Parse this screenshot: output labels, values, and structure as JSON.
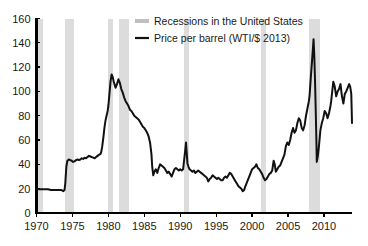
{
  "chart_data": {
    "type": "line",
    "title": "",
    "subtitle": "",
    "xlabel": "",
    "ylabel": "",
    "xlim": [
      1970,
      2013.9
    ],
    "ylim": [
      0,
      160
    ],
    "grid": false,
    "legend_position": "top-center",
    "y_ticks": [
      0,
      20,
      40,
      60,
      80,
      100,
      120,
      140,
      160
    ],
    "y_tick_labels": [
      "0",
      "20",
      "40",
      "60",
      "80",
      "100",
      "120",
      "140",
      "160"
    ],
    "x_ticks": [
      1970,
      1975,
      1980,
      1985,
      1990,
      1995,
      2000,
      2005,
      2010
    ],
    "x_tick_labels": [
      "1970",
      "1975",
      "1980",
      "1985",
      "1990",
      "1995",
      "2000",
      "2005",
      "2010"
    ],
    "legend": [
      {
        "label": "Recessions in the United States",
        "type": "band",
        "color": "#bfbfbf"
      },
      {
        "label": "Price per barrel (WTI/$ 2013)",
        "type": "line",
        "color": "#111111"
      }
    ],
    "series": [
      {
        "name": "Price per barrel (WTI/$ 2013)",
        "color": "#111111",
        "x": [
          1970.0,
          1970.4,
          1970.8,
          1971.2,
          1971.6,
          1972.0,
          1972.4,
          1972.8,
          1973.0,
          1973.2,
          1973.4,
          1973.6,
          1973.75,
          1973.9,
          1974.0,
          1974.15,
          1974.3,
          1974.5,
          1974.7,
          1974.9,
          1975.1,
          1975.3,
          1975.5,
          1975.7,
          1975.9,
          1976.1,
          1976.3,
          1976.5,
          1976.7,
          1976.9,
          1977.1,
          1977.3,
          1977.5,
          1977.7,
          1977.9,
          1978.1,
          1978.3,
          1978.5,
          1978.7,
          1978.9,
          1979.0,
          1979.15,
          1979.3,
          1979.45,
          1979.6,
          1979.75,
          1979.9,
          1980.0,
          1980.15,
          1980.3,
          1980.45,
          1980.6,
          1980.75,
          1980.9,
          1981.0,
          1981.2,
          1981.4,
          1981.6,
          1981.8,
          1982.0,
          1982.2,
          1982.4,
          1982.6,
          1982.8,
          1983.0,
          1983.2,
          1983.4,
          1983.6,
          1983.8,
          1984.0,
          1984.2,
          1984.4,
          1984.6,
          1984.8,
          1985.0,
          1985.2,
          1985.4,
          1985.6,
          1985.8,
          1986.0,
          1986.1,
          1986.25,
          1986.4,
          1986.6,
          1986.8,
          1987.0,
          1987.2,
          1987.4,
          1987.6,
          1987.8,
          1988.0,
          1988.2,
          1988.4,
          1988.6,
          1988.8,
          1989.0,
          1989.2,
          1989.4,
          1989.6,
          1989.8,
          1990.0,
          1990.2,
          1990.4,
          1990.55,
          1990.7,
          1990.8,
          1990.9,
          1991.0,
          1991.15,
          1991.3,
          1991.5,
          1991.7,
          1991.9,
          1992.1,
          1992.3,
          1992.5,
          1992.7,
          1992.9,
          1993.1,
          1993.3,
          1993.5,
          1993.7,
          1993.9,
          1994.1,
          1994.3,
          1994.5,
          1994.7,
          1994.9,
          1995.1,
          1995.3,
          1995.5,
          1995.7,
          1995.9,
          1996.1,
          1996.3,
          1996.5,
          1996.7,
          1996.9,
          1997.1,
          1997.3,
          1997.5,
          1997.7,
          1997.9,
          1998.1,
          1998.3,
          1998.5,
          1998.7,
          1998.9,
          1999.0,
          1999.2,
          1999.4,
          1999.6,
          1999.8,
          2000.0,
          2000.2,
          2000.4,
          2000.6,
          2000.8,
          2001.0,
          2001.2,
          2001.4,
          2001.6,
          2001.8,
          2002.0,
          2002.2,
          2002.4,
          2002.6,
          2002.8,
          2003.0,
          2003.15,
          2003.3,
          2003.5,
          2003.7,
          2003.9,
          2004.1,
          2004.3,
          2004.5,
          2004.7,
          2004.9,
          2005.1,
          2005.3,
          2005.5,
          2005.7,
          2005.9,
          2006.1,
          2006.3,
          2006.5,
          2006.7,
          2006.9,
          2007.1,
          2007.3,
          2007.5,
          2007.7,
          2007.9,
          2008.0,
          2008.15,
          2008.3,
          2008.45,
          2008.55,
          2008.65,
          2008.75,
          2008.85,
          2008.95,
          2009.0,
          2009.15,
          2009.3,
          2009.5,
          2009.7,
          2009.9,
          2010.1,
          2010.3,
          2010.5,
          2010.7,
          2010.9,
          2011.0,
          2011.15,
          2011.3,
          2011.5,
          2011.7,
          2011.9,
          2012.1,
          2012.3,
          2012.5,
          2012.7,
          2012.9,
          2013.1,
          2013.3,
          2013.5,
          2013.65,
          2013.8,
          2013.9
        ],
        "y": [
          20,
          19.5,
          19.5,
          19.5,
          19.5,
          19,
          19,
          19,
          19,
          19,
          19,
          18.5,
          18,
          19,
          24,
          38,
          43,
          44,
          43.5,
          43,
          42,
          42.5,
          43.5,
          44,
          43.5,
          44,
          45,
          44.5,
          45.5,
          45,
          46,
          47,
          46.5,
          46,
          45.5,
          45,
          46,
          47,
          48,
          48.5,
          50,
          55,
          62,
          70,
          76,
          80,
          84,
          88,
          98,
          108,
          114,
          112,
          108,
          105,
          103,
          106,
          110,
          107,
          102,
          99,
          95,
          92,
          90,
          88,
          85,
          84,
          82,
          80,
          79,
          78,
          77,
          75,
          73,
          71,
          70,
          68,
          66,
          63,
          58,
          48,
          38,
          31,
          34,
          36,
          33,
          37,
          40,
          39,
          38,
          37,
          35,
          33,
          34,
          32,
          30,
          33,
          36,
          37,
          36,
          35,
          36,
          35,
          36,
          44,
          52,
          58,
          50,
          41,
          38,
          36,
          35,
          34,
          35,
          33,
          34,
          35,
          34,
          33,
          32,
          31,
          30,
          29,
          26,
          28,
          29,
          31,
          30,
          29,
          28,
          29,
          28,
          27,
          27,
          29,
          30,
          29,
          31,
          33,
          32,
          30,
          28,
          26,
          24,
          22,
          21,
          20,
          18,
          19,
          21,
          24,
          27,
          30,
          33,
          36,
          37,
          38,
          40,
          37,
          36,
          34,
          32,
          29,
          27,
          28,
          30,
          32,
          33,
          35,
          43,
          40,
          34,
          36,
          38,
          39,
          42,
          45,
          48,
          55,
          58,
          56,
          60,
          66,
          70,
          66,
          68,
          74,
          78,
          76,
          70,
          68,
          72,
          80,
          86,
          92,
          97,
          110,
          122,
          134,
          143,
          130,
          110,
          85,
          58,
          42,
          47,
          55,
          68,
          74,
          78,
          84,
          82,
          78,
          82,
          88,
          92,
          100,
          108,
          104,
          96,
          100,
          102,
          106,
          96,
          90,
          98,
          100,
          103,
          106,
          104,
          98,
          74
        ]
      }
    ],
    "recessions": [
      {
        "start": 1969.9,
        "end": 1970.9
      },
      {
        "start": 1973.9,
        "end": 1975.2
      },
      {
        "start": 1980.0,
        "end": 1980.6
      },
      {
        "start": 1981.5,
        "end": 1982.9
      },
      {
        "start": 1990.5,
        "end": 1991.2
      },
      {
        "start": 2001.2,
        "end": 2001.9
      },
      {
        "start": 2007.9,
        "end": 2009.4
      }
    ]
  }
}
